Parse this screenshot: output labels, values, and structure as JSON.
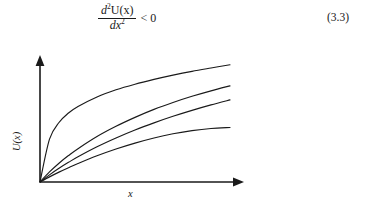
{
  "equation": {
    "numerator_d": "d",
    "numerator_exp": "2",
    "numerator_fn": "U(x)",
    "denominator_d": "dx",
    "denominator_exp": "2",
    "relation": "< 0",
    "number": "(3.3)"
  },
  "figure": {
    "y_axis_label": "U(x)",
    "x_axis_label": "x"
  },
  "chart_data": {
    "type": "line",
    "title": "",
    "xlabel": "x",
    "ylabel": "U(x)",
    "xlim": [
      0,
      1
    ],
    "ylim": [
      0,
      1
    ],
    "grid": false,
    "legend": "none",
    "annotation": "Four concave (diminishing marginal utility) curves through the origin; d²U(x)/dx² < 0",
    "x": [
      0,
      0.05,
      0.1,
      0.15,
      0.2,
      0.3,
      0.4,
      0.5,
      0.6,
      0.7,
      0.8,
      0.9,
      1.0
    ],
    "series": [
      {
        "name": "curve-1-most-concave",
        "values": [
          0,
          0.36,
          0.5,
          0.58,
          0.635,
          0.715,
          0.775,
          0.822,
          0.862,
          0.898,
          0.93,
          0.958,
          0.985
        ]
      },
      {
        "name": "curve-2",
        "values": [
          0,
          0.085,
          0.158,
          0.222,
          0.28,
          0.382,
          0.468,
          0.543,
          0.61,
          0.668,
          0.72,
          0.766,
          0.808
        ]
      },
      {
        "name": "curve-3",
        "values": [
          0,
          0.06,
          0.115,
          0.165,
          0.212,
          0.296,
          0.37,
          0.437,
          0.497,
          0.552,
          0.602,
          0.648,
          0.69
        ]
      },
      {
        "name": "curve-4-flattest",
        "values": [
          0,
          0.043,
          0.083,
          0.12,
          0.155,
          0.22,
          0.277,
          0.327,
          0.37,
          0.405,
          0.432,
          0.45,
          0.458
        ]
      }
    ]
  }
}
